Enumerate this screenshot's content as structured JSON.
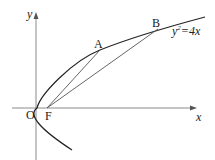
{
  "diagram": {
    "type": "parabola-focal-chords",
    "equation_label": "y²=4x",
    "equation_base": "y",
    "equation_sup": "2",
    "equation_rest": "=4x",
    "axes": {
      "x_label": "x",
      "y_label": "y",
      "origin_label": "O"
    },
    "points": [
      {
        "name": "A",
        "label": "A"
      },
      {
        "name": "B",
        "label": "B"
      },
      {
        "name": "F",
        "label": "F"
      }
    ],
    "segments": [
      "FA",
      "FB"
    ],
    "colors": {
      "curve": "#222222",
      "axis": "#888888",
      "segment": "#555555",
      "text": "#222222"
    }
  }
}
